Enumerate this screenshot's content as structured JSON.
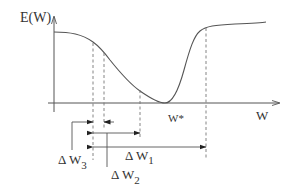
{
  "diagram": {
    "y_axis_label": "E(W)",
    "x_axis_label": "W",
    "minimum_label": "W*",
    "intervals": [
      {
        "id": "dw1",
        "symbol": "Δ W",
        "subscript": "1"
      },
      {
        "id": "dw2",
        "symbol": "Δ W",
        "subscript": "2"
      },
      {
        "id": "dw3",
        "symbol": "Δ W",
        "subscript": "3"
      }
    ]
  }
}
